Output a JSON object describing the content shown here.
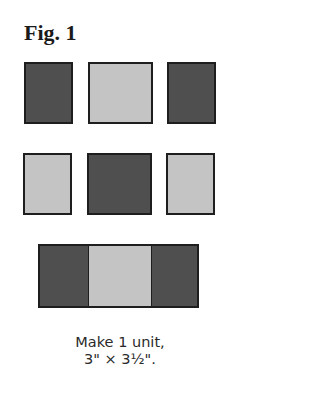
{
  "figure": {
    "title": "Fig. 1",
    "colors": {
      "dark": "#4f4f4f",
      "light": "#c4c4c4",
      "outline": "#1e1e1e"
    },
    "rows": [
      {
        "pieces": [
          "dark",
          "light",
          "dark"
        ]
      },
      {
        "pieces": [
          "light",
          "dark",
          "light"
        ]
      }
    ],
    "unit": {
      "pieces": [
        "dark",
        "light",
        "dark"
      ]
    },
    "caption": {
      "line1": "Make 1 unit,",
      "line2": "3\" × 3½\"."
    }
  }
}
